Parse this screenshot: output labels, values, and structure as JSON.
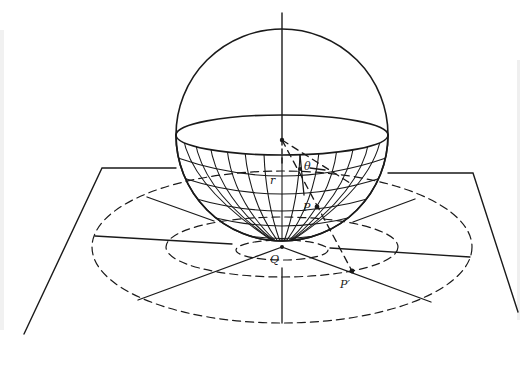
{
  "figure": {
    "labels": {
      "theta": "θ",
      "r": "r",
      "P": "P",
      "P_prime": "P′",
      "Q": "Q"
    },
    "colors": {
      "ink": "#1a1a1a",
      "background": "#ffffff"
    },
    "sphere": {
      "cx": 282,
      "cy": 139,
      "r": 106,
      "meridians": 15,
      "parallels": 5
    },
    "plane": {
      "corners": [
        [
          102,
          168
        ],
        [
          473,
          173
        ],
        [
          518,
          312
        ],
        [
          24,
          334
        ]
      ]
    },
    "projection_circles": [
      {
        "name": "inner",
        "rx": 46,
        "ry": 10
      },
      {
        "name": "middle",
        "rx": 116,
        "ry": 30
      },
      {
        "name": "outer",
        "rx": 190,
        "ry": 76
      }
    ],
    "tangent_point": {
      "x": 282,
      "y": 247
    }
  }
}
